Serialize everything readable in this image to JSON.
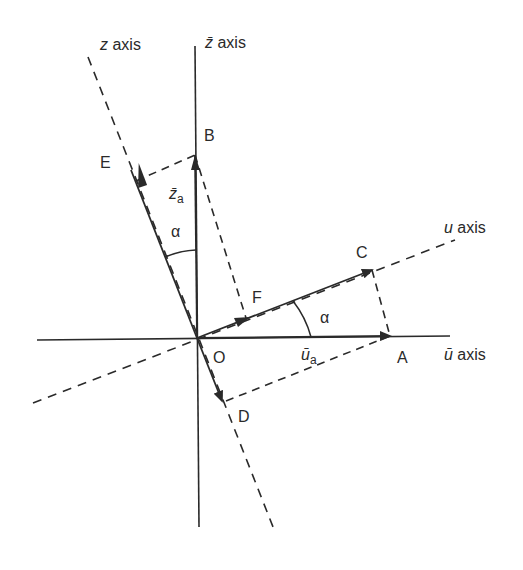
{
  "diagram": {
    "type": "coordinate-rotation",
    "colors": {
      "line": "#2a2a2a",
      "background": "#ffffff"
    },
    "axes": {
      "z_axis": {
        "var": "z",
        "suffix": " axis"
      },
      "z_bar_axis": {
        "var": "z̄",
        "suffix": " axis"
      },
      "u_axis": {
        "var": "u",
        "suffix": " axis"
      },
      "u_bar_axis": {
        "var": "ū",
        "suffix": " axis"
      }
    },
    "points": {
      "O": "O",
      "A": "A",
      "B": "B",
      "C": "C",
      "D": "D",
      "E": "E",
      "F": "F"
    },
    "angle_labels": {
      "alpha_top": "α",
      "alpha_right": "α"
    },
    "components": {
      "z_bar_a": {
        "var": "z̄",
        "sub": "a"
      },
      "u_bar_a": {
        "var": "ū",
        "sub": "a"
      }
    }
  }
}
